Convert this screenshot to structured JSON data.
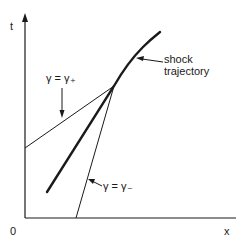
{
  "diagram": {
    "axes": {
      "y_label": "t",
      "x_label": "x",
      "origin_label": "0"
    },
    "labels": {
      "gamma_plus": "γ = γ₊",
      "gamma_minus": "γ = γ₋",
      "shock_line1": "shock",
      "shock_line2": "trajectory"
    },
    "colors": {
      "line": "#1a1a1a",
      "background": "#ffffff"
    }
  }
}
